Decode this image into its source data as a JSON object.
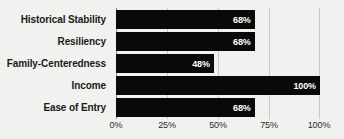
{
  "chart_data": {
    "type": "bar",
    "orientation": "horizontal",
    "title": "",
    "subtitle": "",
    "xlabel": "",
    "ylabel": "",
    "categories": [
      "Historical Stability",
      "Resiliency",
      "Family-Centeredness",
      "Income",
      "Ease of Entry"
    ],
    "values": [
      68,
      68,
      48,
      100,
      68
    ],
    "value_labels": [
      "68%",
      "68%",
      "48%",
      "100%",
      "68%"
    ],
    "xlim": [
      0,
      100
    ],
    "xticks": [
      0,
      25,
      50,
      75,
      100
    ],
    "xtick_labels": [
      "0%",
      "25%",
      "50%",
      "75%",
      "100%"
    ],
    "grid": true,
    "legend": false,
    "bar_color": "#090909",
    "value_label_color": "#ffffff",
    "gridline_color": "#c9c9c7",
    "axis_color": "#8d8d8b",
    "background_color": "#f1f1ef",
    "category_label_color": "#1a1a1a"
  }
}
